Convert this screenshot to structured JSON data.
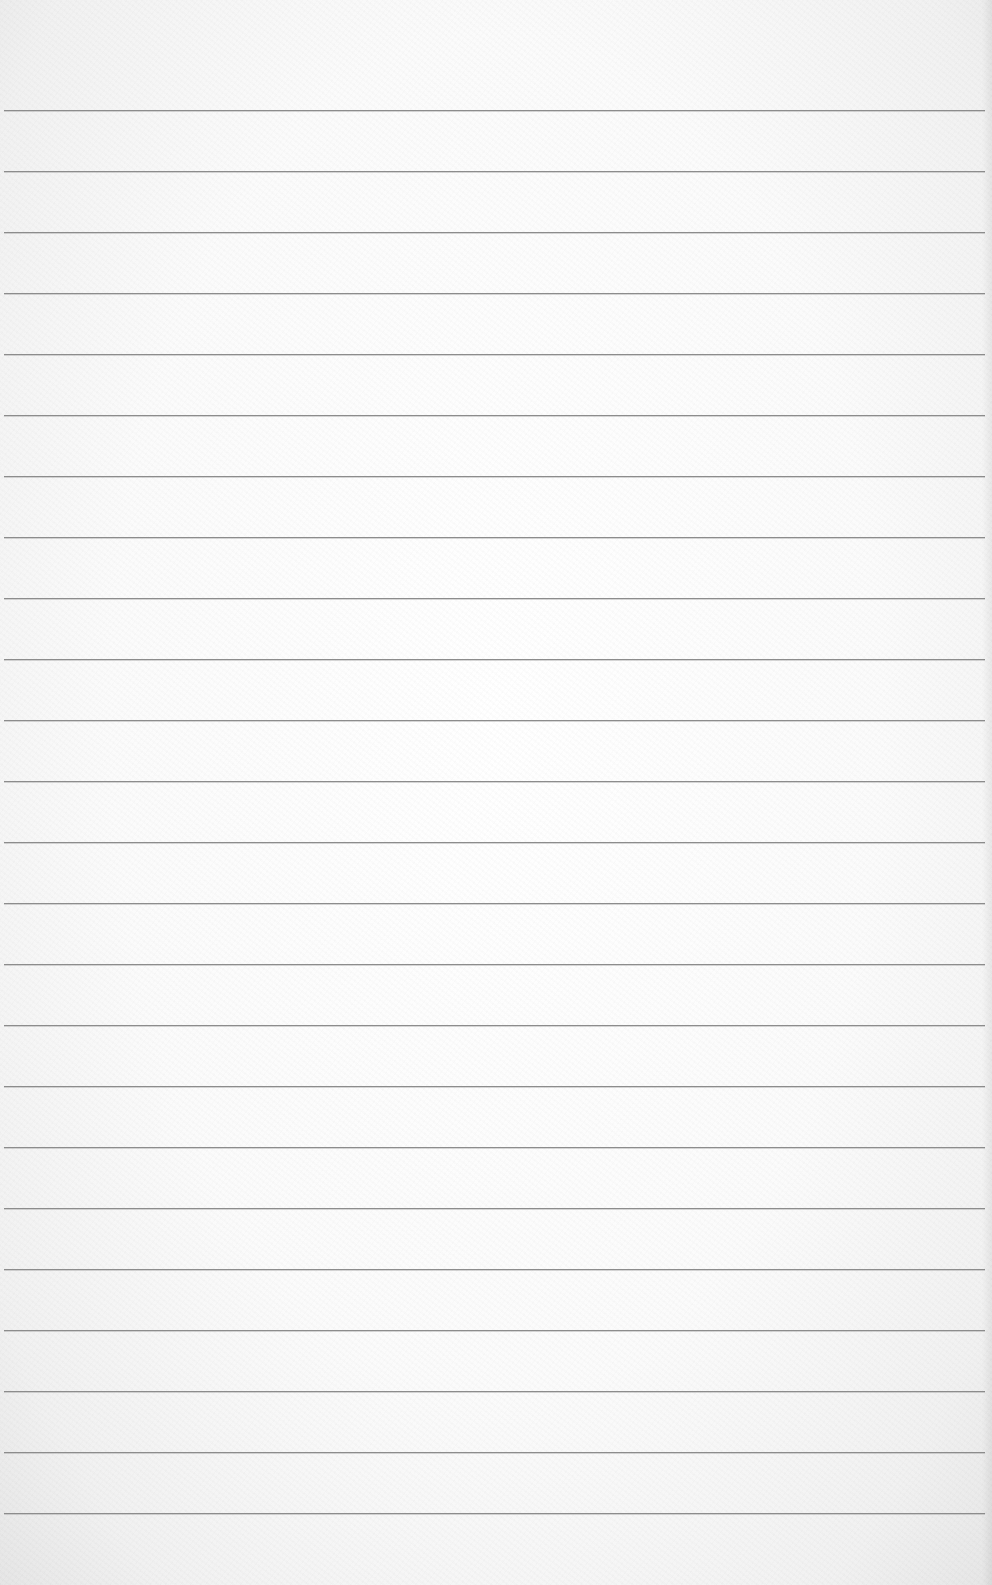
{
  "page": {
    "type": "lined-paper",
    "paper_color": "#fafafa",
    "line_color": "#8c8c8c",
    "line_count": 24,
    "first_line_y": 110,
    "line_spacing": 61,
    "line_left_x": 4,
    "line_width": 981
  }
}
